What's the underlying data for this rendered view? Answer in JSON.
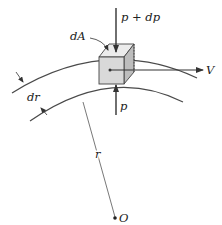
{
  "figure": {
    "type": "streamline-fluid-element",
    "labels": {
      "pressure_top": "p + dp",
      "area": "dA",
      "pressure_bottom": "p",
      "velocity": "V",
      "thickness": "dr",
      "radius": "r",
      "center": "O"
    },
    "colors": {
      "line": "#4a4a4a",
      "arrow": "#333333",
      "cube_front": "#d9d9d9",
      "cube_top": "#ececec",
      "cube_side": "#bdbdbd",
      "text": "#222222"
    }
  }
}
